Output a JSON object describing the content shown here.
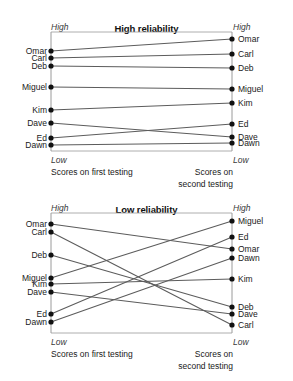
{
  "chart_data": [
    {
      "type": "line",
      "subtype": "slopegraph",
      "title": "High reliability",
      "xlabel": "",
      "ylabel": "",
      "grid": false,
      "legend": null,
      "axis_caps": {
        "top_left": "High",
        "top_right": "High",
        "bottom_left": "Low",
        "bottom_right": "Low"
      },
      "x_axis_labels": {
        "left_line1": "Scores on",
        "left_line2": "first testing",
        "right_line1": "Scores on",
        "right_line2": "second testing"
      },
      "categories": [
        "first testing",
        "second testing"
      ],
      "series": [
        {
          "name": "Omar",
          "left_rank": 1,
          "right_rank": 1,
          "left_y": 51,
          "right_y": 39
        },
        {
          "name": "Carl",
          "left_rank": 2,
          "right_rank": 2,
          "left_y": 58,
          "right_y": 54
        },
        {
          "name": "Deb",
          "left_rank": 3,
          "right_rank": 3,
          "left_y": 66,
          "right_y": 68
        },
        {
          "name": "Miguel",
          "left_rank": 4,
          "right_rank": 4,
          "left_y": 87,
          "right_y": 89
        },
        {
          "name": "Kim",
          "left_rank": 5,
          "right_rank": 5,
          "left_y": 110,
          "right_y": 103
        },
        {
          "name": "Dave",
          "left_rank": 6,
          "right_rank": 7,
          "left_y": 123,
          "right_y": 137
        },
        {
          "name": "Ed",
          "left_rank": 7,
          "right_rank": 6,
          "left_y": 138,
          "right_y": 124
        },
        {
          "name": "Dawn",
          "left_rank": 8,
          "right_rank": 8,
          "left_y": 145,
          "right_y": 143
        }
      ],
      "left_labels": [
        "Omar",
        "Carl",
        "Deb",
        "Miguel",
        "Kim",
        "Dave",
        "Ed",
        "Dawn"
      ],
      "right_labels": [
        "Omar",
        "Carl",
        "Deb",
        "Miguel",
        "Kim",
        "Ed",
        "Dave",
        "Dawn"
      ]
    },
    {
      "type": "line",
      "subtype": "slopegraph",
      "title": "Low reliability",
      "xlabel": "",
      "ylabel": "",
      "grid": false,
      "legend": null,
      "axis_caps": {
        "top_left": "High",
        "top_right": "High",
        "bottom_left": "Low",
        "bottom_right": "Low"
      },
      "x_axis_labels": {
        "left_line1": "Scores on",
        "left_line2": "first testing",
        "right_line1": "Scores on",
        "right_line2": "second testing"
      },
      "categories": [
        "first testing",
        "second testing"
      ],
      "series": [
        {
          "name": "Omar",
          "left_rank": 1,
          "right_rank": 3,
          "left_y": 224,
          "right_y": 249
        },
        {
          "name": "Carl",
          "left_rank": 2,
          "right_rank": 8,
          "left_y": 232,
          "right_y": 325
        },
        {
          "name": "Deb",
          "left_rank": 3,
          "right_rank": 6,
          "left_y": 255,
          "right_y": 307
        },
        {
          "name": "Miguel",
          "left_rank": 4,
          "right_rank": 1,
          "left_y": 278,
          "right_y": 221
        },
        {
          "name": "Kim",
          "left_rank": 5,
          "right_rank": 5,
          "left_y": 284,
          "right_y": 279
        },
        {
          "name": "Dave",
          "left_rank": 6,
          "right_rank": 7,
          "left_y": 292,
          "right_y": 314
        },
        {
          "name": "Ed",
          "left_rank": 7,
          "right_rank": 2,
          "left_y": 314,
          "right_y": 237
        },
        {
          "name": "Dawn",
          "left_rank": 8,
          "right_rank": 4,
          "left_y": 322,
          "right_y": 258
        }
      ],
      "left_labels": [
        "Omar",
        "Carl",
        "Deb",
        "Miguel",
        "Kim",
        "Dave",
        "Ed",
        "Dawn"
      ],
      "right_labels": [
        "Miguel",
        "Ed",
        "Omar",
        "Dawn",
        "Kim",
        "Deb",
        "Dave",
        "Carl"
      ]
    }
  ],
  "colors": {
    "line": "#5c5c5c",
    "dot": "#111111",
    "axis": "#9a9a9a",
    "text": "#1a1a1a",
    "background": "#ffffff"
  },
  "top": {
    "title": "High reliability",
    "cap_high_left": "High",
    "cap_high_right": "High",
    "cap_low_left": "Low",
    "cap_low_right": "Low",
    "foot_left_1": "Scores on",
    "foot_left_2": "first testing",
    "foot_right_1": "Scores on",
    "foot_right_2": "second testing",
    "left": [
      {
        "name": "Omar",
        "y": 51
      },
      {
        "name": "Carl",
        "y": 58
      },
      {
        "name": "Deb",
        "y": 66
      },
      {
        "name": "Miguel",
        "y": 87
      },
      {
        "name": "Kim",
        "y": 110
      },
      {
        "name": "Dave",
        "y": 123
      },
      {
        "name": "Ed",
        "y": 138
      },
      {
        "name": "Dawn",
        "y": 145
      }
    ],
    "right": [
      {
        "name": "Omar",
        "y": 39
      },
      {
        "name": "Carl",
        "y": 54
      },
      {
        "name": "Deb",
        "y": 68
      },
      {
        "name": "Miguel",
        "y": 89
      },
      {
        "name": "Kim",
        "y": 103
      },
      {
        "name": "Ed",
        "y": 124
      },
      {
        "name": "Dave",
        "y": 137
      },
      {
        "name": "Dawn",
        "y": 143
      }
    ]
  },
  "bottom": {
    "title": "Low reliability",
    "cap_high_left": "High",
    "cap_high_right": "High",
    "cap_low_left": "Low",
    "cap_low_right": "Low",
    "foot_left_1": "Scores on",
    "foot_left_2": "first testing",
    "foot_right_1": "Scores on",
    "foot_right_2": "second testing",
    "left": [
      {
        "name": "Omar",
        "y": 224
      },
      {
        "name": "Carl",
        "y": 232
      },
      {
        "name": "Deb",
        "y": 255
      },
      {
        "name": "Miguel",
        "y": 278
      },
      {
        "name": "Kim",
        "y": 284
      },
      {
        "name": "Dave",
        "y": 292
      },
      {
        "name": "Ed",
        "y": 314
      },
      {
        "name": "Dawn",
        "y": 322
      }
    ],
    "right": [
      {
        "name": "Miguel",
        "y": 221
      },
      {
        "name": "Ed",
        "y": 237
      },
      {
        "name": "Omar",
        "y": 249
      },
      {
        "name": "Dawn",
        "y": 258
      },
      {
        "name": "Kim",
        "y": 279
      },
      {
        "name": "Deb",
        "y": 307
      },
      {
        "name": "Dave",
        "y": 314
      },
      {
        "name": "Carl",
        "y": 325
      }
    ]
  },
  "geometry": {
    "x_left": 51,
    "x_right": 232,
    "top_box_top": 32,
    "top_box_bottom": 151,
    "bottom_box_top": 213,
    "bottom_box_bottom": 333
  }
}
